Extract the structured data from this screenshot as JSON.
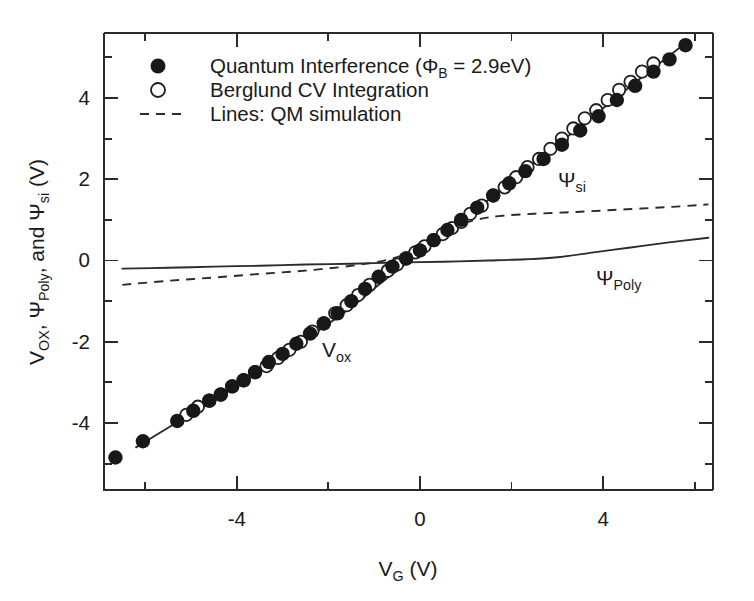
{
  "chart_data": {
    "type": "scatter",
    "title": "",
    "xlabel": "V_G (V)",
    "ylabel": "V_OX, Ψ_Poly, and Ψ_si (V)",
    "xlim": [
      -6.9,
      6.4
    ],
    "ylim": [
      -5.65,
      5.6
    ],
    "grid": false,
    "legend_position": "top-left",
    "x_ticks_major": [
      -4,
      0,
      4
    ],
    "x_ticks_minor": [
      -6,
      -2,
      2,
      6
    ],
    "x_tick_labels": [
      "-4",
      "0",
      "4"
    ],
    "y_ticks_major": [
      -4,
      -2,
      0,
      2,
      4
    ],
    "y_ticks_minor": [
      -5,
      -3,
      -1,
      1,
      3,
      5
    ],
    "y_tick_labels": [
      "-4",
      "-2",
      "0",
      "2",
      "4"
    ],
    "series": [
      {
        "name": "Quantum Interference (ΦB = 2.9eV)",
        "marker": "filled-circle",
        "x": [
          -6.65,
          -6.05,
          -5.3,
          -4.95,
          -4.6,
          -4.35,
          -4.1,
          -3.85,
          -3.6,
          -3.3,
          -3.0,
          -2.7,
          -2.4,
          -2.1,
          -1.8,
          -1.5,
          -1.2,
          -0.9,
          -0.6,
          -0.3,
          0.0,
          0.3,
          0.6,
          0.9,
          1.25,
          1.6,
          1.95,
          2.3,
          2.7,
          3.1,
          3.5,
          3.9,
          4.3,
          4.7,
          5.1,
          5.45,
          5.8
        ],
        "y": [
          -4.85,
          -4.45,
          -3.95,
          -3.7,
          -3.45,
          -3.3,
          -3.1,
          -2.95,
          -2.75,
          -2.5,
          -2.3,
          -2.05,
          -1.8,
          -1.55,
          -1.3,
          -1.0,
          -0.7,
          -0.4,
          -0.15,
          0.05,
          0.25,
          0.5,
          0.75,
          1.0,
          1.3,
          1.6,
          1.9,
          2.2,
          2.5,
          2.85,
          3.2,
          3.55,
          3.95,
          4.3,
          4.65,
          4.95,
          5.3
        ]
      },
      {
        "name": "Berglund CV Integration",
        "marker": "open-circle",
        "x": [
          -5.1,
          -4.85,
          -4.6,
          -4.35,
          -4.1,
          -3.85,
          -3.6,
          -3.35,
          -3.1,
          -2.85,
          -2.6,
          -2.35,
          -2.1,
          -1.85,
          -1.6,
          -1.35,
          -1.1,
          -0.9,
          -0.7,
          -0.5,
          -0.3,
          -0.1,
          0.1,
          0.3,
          0.5,
          0.7,
          0.9,
          1.1,
          1.35,
          1.6,
          1.85,
          2.1,
          2.35,
          2.6,
          2.85,
          3.1,
          3.35,
          3.6,
          3.85,
          4.1,
          4.35,
          4.6,
          4.85,
          5.1
        ],
        "y": [
          -3.8,
          -3.6,
          -3.45,
          -3.3,
          -3.1,
          -2.95,
          -2.75,
          -2.6,
          -2.4,
          -2.2,
          -2.0,
          -1.75,
          -1.55,
          -1.3,
          -1.1,
          -0.85,
          -0.6,
          -0.4,
          -0.25,
          -0.1,
          0.05,
          0.2,
          0.35,
          0.5,
          0.65,
          0.8,
          0.95,
          1.15,
          1.35,
          1.6,
          1.8,
          2.05,
          2.3,
          2.5,
          2.75,
          3.0,
          3.25,
          3.5,
          3.7,
          3.95,
          4.2,
          4.4,
          4.65,
          4.85
        ]
      },
      {
        "name": "V_OX (QM simulation line)",
        "marker": "line-solid",
        "x": [
          -6.2,
          -5.4,
          -4.5,
          -3.5,
          -2.5,
          -1.5,
          -0.9,
          0.0,
          1.0,
          2.0,
          3.0,
          4.0,
          5.0,
          5.8
        ],
        "y": [
          -4.6,
          -4.05,
          -3.45,
          -2.7,
          -1.95,
          -1.15,
          -0.6,
          0.2,
          1.05,
          1.95,
          2.85,
          3.75,
          4.65,
          5.35
        ]
      },
      {
        "name": "Ψ_si (QM simulation, dashed)",
        "marker": "line-dashed",
        "x": [
          -6.5,
          -5.5,
          -4.5,
          -3.5,
          -2.5,
          -1.5,
          -0.7,
          0.0,
          0.5,
          0.9,
          1.3,
          1.8,
          2.5,
          3.5,
          4.5,
          5.5,
          6.3
        ],
        "y": [
          -0.6,
          -0.5,
          -0.42,
          -0.33,
          -0.25,
          -0.13,
          0.02,
          0.3,
          0.62,
          0.88,
          1.02,
          1.1,
          1.15,
          1.2,
          1.26,
          1.32,
          1.38
        ]
      },
      {
        "name": "Ψ_Poly (QM simulation, solid)",
        "marker": "line-solid",
        "x": [
          -6.5,
          -5.5,
          -4.5,
          -3.5,
          -2.5,
          -1.5,
          -0.5,
          0.5,
          1.5,
          2.3,
          3.0,
          3.8,
          4.6,
          5.4,
          6.3
        ],
        "y": [
          -0.2,
          -0.18,
          -0.15,
          -0.13,
          -0.1,
          -0.08,
          -0.05,
          -0.03,
          0.0,
          0.03,
          0.08,
          0.2,
          0.32,
          0.44,
          0.56
        ]
      }
    ],
    "annotations": [
      {
        "text": "V_ox",
        "x": -1.3,
        "y": -2.35
      },
      {
        "text": "Ψ_si",
        "x": 4.2,
        "y": 1.95
      },
      {
        "text": "Ψ_Poly",
        "x": 4.6,
        "y": -0.45
      }
    ]
  },
  "axes": {
    "x_title_main": "V",
    "x_title_sub": "G",
    "x_title_unit": " (V)",
    "y_title_part1_main": "V",
    "y_title_part1_sub": "OX",
    "y_title_part2": ", Ψ",
    "y_title_part2_sub": "Poly",
    "y_title_part3": ", and Ψ",
    "y_title_part3_sub": "si",
    "y_title_unit": " (V)",
    "x_tick_labels": [
      "-4",
      "0",
      "4"
    ],
    "y_tick_labels": [
      "4",
      "2",
      "0",
      "-2",
      "-4"
    ]
  },
  "legend": {
    "entries": [
      {
        "marker": "filled-circle",
        "label_main": "Quantum Interference (Φ",
        "label_sub": "B",
        "label_tail": " = 2.9eV)"
      },
      {
        "marker": "open-circle",
        "label_main": "Berglund CV Integration",
        "label_sub": "",
        "label_tail": ""
      },
      {
        "marker": "dashed-line",
        "label_main": "Lines: QM simulation",
        "label_sub": "",
        "label_tail": ""
      }
    ]
  },
  "annotations": {
    "vox_main": "V",
    "vox_sub": "ox",
    "psisi_main": "Ψ",
    "psisi_sub": "si",
    "psipoly_main": "Ψ",
    "psipoly_sub": "Poly"
  },
  "colors": {
    "ink": "#1a1a1a",
    "axis": "#2b2b2b",
    "background": "#ffffff",
    "marker_fill": "#181818"
  }
}
